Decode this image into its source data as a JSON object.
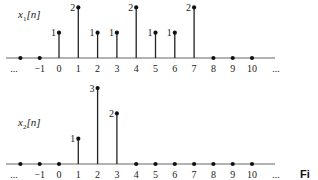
{
  "chart_data": [
    {
      "type": "stem",
      "title": "x1[n]",
      "signal_name": "x",
      "signal_subscript": "1",
      "signal_arg": "[n]",
      "xlabel": "n",
      "x_ticks": [
        "...",
        "-1",
        "0",
        "1",
        "2",
        "3",
        "4",
        "5",
        "6",
        "7",
        "8",
        "9",
        "10",
        "..."
      ],
      "x": [
        -2,
        -1,
        0,
        1,
        2,
        3,
        4,
        5,
        6,
        7,
        8,
        9,
        10,
        11
      ],
      "values": [
        0,
        0,
        1,
        2,
        1,
        1,
        2,
        1,
        1,
        2,
        0,
        0,
        0,
        0
      ],
      "value_labels": {
        "0": "1",
        "1": "2",
        "2": "1",
        "3": "1",
        "4": "2",
        "5": "1",
        "6": "1",
        "7": "2"
      }
    },
    {
      "type": "stem",
      "title": "x2[n]",
      "signal_name": "x",
      "signal_subscript": "2",
      "signal_arg": "[n]",
      "xlabel": "n",
      "x_ticks": [
        "...",
        "-1",
        "0",
        "1",
        "2",
        "3",
        "4",
        "5",
        "6",
        "7",
        "8",
        "9",
        "10",
        "..."
      ],
      "x": [
        -2,
        -1,
        0,
        1,
        2,
        3,
        4,
        5,
        6,
        7,
        8,
        9,
        10,
        11
      ],
      "values": [
        0,
        0,
        0,
        1,
        3,
        2,
        0,
        0,
        0,
        0,
        0,
        0,
        0,
        0
      ],
      "value_labels": {
        "1": "1",
        "2": "3",
        "3": "2"
      }
    }
  ],
  "caption_fragment": "Fi",
  "colors": {
    "stroke": "#222222",
    "axis": "#555555"
  }
}
